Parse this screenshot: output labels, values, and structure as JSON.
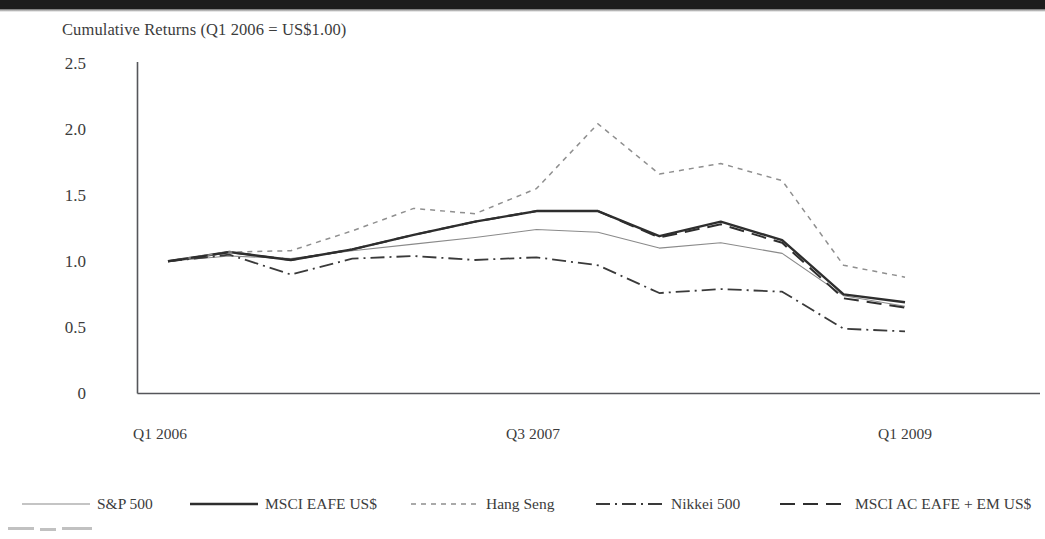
{
  "chart_data": {
    "type": "line",
    "title": "Cumulative Returns (Q1 2006 = US$1.00)",
    "xlabel": "",
    "ylabel": "",
    "ylim": [
      0,
      2.5
    ],
    "yticks": [
      "0",
      "0.5",
      "1.0",
      "1.5",
      "2.0",
      "2.5"
    ],
    "ytick_values": [
      0,
      0.5,
      1.0,
      1.5,
      2.0,
      2.5
    ],
    "grid": false,
    "legend_position": "bottom",
    "x_axis_labels": [
      "Q1 2006",
      "Q3 2007",
      "Q1 2009"
    ],
    "x_label_positions": [
      0,
      6,
      12
    ],
    "x": [
      "Q1 2006",
      "Q2 2006",
      "Q3 2006",
      "Q4 2006",
      "Q1 2007",
      "Q2 2007",
      "Q3 2007",
      "Q4 2007",
      "Q1 2008",
      "Q2 2008",
      "Q3 2008",
      "Q4 2008",
      "Q1 2009"
    ],
    "series": [
      {
        "name": "S&P 500",
        "style": "solid-thin",
        "color": "#8a8a8a",
        "values": [
          1.0,
          1.04,
          1.02,
          1.08,
          1.13,
          1.18,
          1.24,
          1.22,
          1.1,
          1.14,
          1.06,
          0.74,
          0.66
        ]
      },
      {
        "name": "MSCI EAFE US$",
        "style": "solid-bold",
        "color": "#2e2e2e",
        "values": [
          1.0,
          1.07,
          1.01,
          1.09,
          1.2,
          1.3,
          1.38,
          1.38,
          1.19,
          1.3,
          1.16,
          0.75,
          0.69
        ]
      },
      {
        "name": "Hang Seng",
        "style": "dotted",
        "color": "#8f8f8f",
        "values": [
          1.0,
          1.07,
          1.08,
          1.23,
          1.4,
          1.36,
          1.55,
          2.04,
          1.66,
          1.74,
          1.61,
          0.97,
          0.88
        ]
      },
      {
        "name": "Nikkei 500",
        "style": "dash-dot",
        "color": "#3a3a3a",
        "values": [
          1.0,
          1.05,
          0.9,
          1.02,
          1.04,
          1.01,
          1.03,
          0.97,
          0.76,
          0.79,
          0.77,
          0.49,
          0.47
        ]
      },
      {
        "name": "MSCI AC EAFE + EM US$",
        "style": "dashed",
        "color": "#2e2e2e",
        "values": [
          1.0,
          1.07,
          1.01,
          1.09,
          1.2,
          1.3,
          1.38,
          1.38,
          1.18,
          1.28,
          1.14,
          0.72,
          0.65
        ]
      }
    ]
  },
  "legend": {
    "items": [
      {
        "label": "S&P 500"
      },
      {
        "label": "MSCI EAFE US$"
      },
      {
        "label": "Hang Seng"
      },
      {
        "label": "Nikkei 500"
      },
      {
        "label": "MSCI AC EAFE + EM US$"
      }
    ]
  }
}
